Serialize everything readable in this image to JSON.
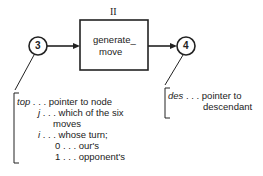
{
  "diagram": {
    "process": {
      "number": "II",
      "label_line1": "generate_",
      "label_line2": "move"
    },
    "nodes": [
      {
        "id": "3"
      },
      {
        "id": "4"
      }
    ],
    "input_annotation": [
      {
        "var": "top",
        "sep": " . . . ",
        "desc": "pointer to node"
      },
      {
        "var": "j",
        "sep": " . . . ",
        "desc": "which of the six"
      },
      {
        "cont": "moves"
      },
      {
        "var": "i",
        "sep": " . . . ",
        "desc": "whose turn;"
      },
      {
        "cont": "0 . . . our's"
      },
      {
        "cont": "1 . . . opponent's"
      }
    ],
    "output_annotation": [
      {
        "var": "des",
        "sep": " . . . ",
        "desc": "pointer to"
      },
      {
        "cont": "descendant"
      }
    ]
  }
}
